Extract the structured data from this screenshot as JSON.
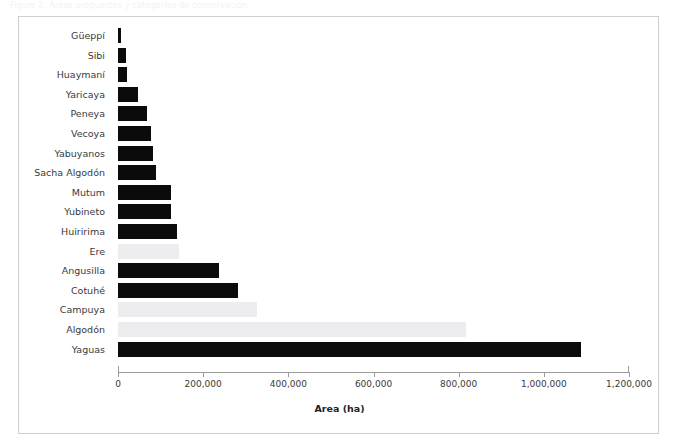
{
  "figure": {
    "caption_fragment": "Figure 2. Áreas propuestas y categorías de conservación",
    "panel_border_color": "#cfcfcf",
    "background_color": "#ffffff"
  },
  "chart_data": {
    "type": "bar",
    "orientation": "horizontal",
    "title": "",
    "subtitle": "",
    "xlabel": "Area (ha)",
    "ylabel": "",
    "xlim": [
      0,
      1200000
    ],
    "xticks": [
      0,
      200000,
      400000,
      600000,
      800000,
      1000000,
      1200000
    ],
    "xtick_labels": [
      "0",
      "200,000",
      "400,000",
      "600,000",
      "800,000",
      "1,000,000",
      "1,200,000"
    ],
    "grid": false,
    "legend": null,
    "legend_position": "none",
    "colors": {
      "dark": "#0b0b0b",
      "light": "#ededef",
      "axis": "#9b9b9b",
      "text": "#3a3a3a"
    },
    "categories": [
      "Güeppí",
      "Sibi",
      "Huaymaní",
      "Yaricaya",
      "Peneya",
      "Vecoya",
      "Yabuyanos",
      "Sacha Algodón",
      "Mutum",
      "Yubineto",
      "Huiririma",
      "Ere",
      "Angusilla",
      "Cotuhé",
      "Campuya",
      "Algodón",
      "Yaguas"
    ],
    "values": [
      8000,
      18000,
      22000,
      48000,
      69000,
      78000,
      82000,
      90000,
      125000,
      125000,
      139000,
      143000,
      237000,
      282000,
      326000,
      817000,
      1087000
    ],
    "bar_styles": [
      "dark",
      "dark",
      "dark",
      "dark",
      "dark",
      "dark",
      "dark",
      "dark",
      "dark",
      "dark",
      "dark",
      "light",
      "dark",
      "dark",
      "light",
      "light",
      "dark"
    ]
  }
}
